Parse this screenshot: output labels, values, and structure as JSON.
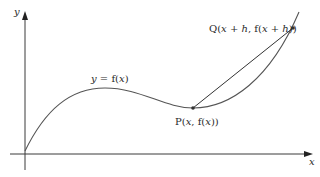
{
  "diagram": {
    "type": "secant-line-graph",
    "axes": {
      "x_label": "x",
      "y_label": "y"
    },
    "curve": {
      "label": "y = f(x)",
      "label_parts": [
        "y",
        " = f(",
        "x",
        ")"
      ]
    },
    "points": [
      {
        "id": "P",
        "label": "P(x, f(x))",
        "label_parts": [
          "P(",
          "x",
          ", f(",
          "x",
          "))"
        ]
      },
      {
        "id": "Q",
        "label": "Q(x + h, f(x + h))",
        "label_parts": [
          "Q(",
          "x",
          " + ",
          "h",
          ", f(",
          "x",
          " + ",
          "h",
          "))"
        ]
      }
    ],
    "secant": {
      "from": "P",
      "to": "Q"
    },
    "colors": {
      "line": "#3a3a3a",
      "text": "#2a2a2a",
      "background": "#ffffff"
    }
  }
}
